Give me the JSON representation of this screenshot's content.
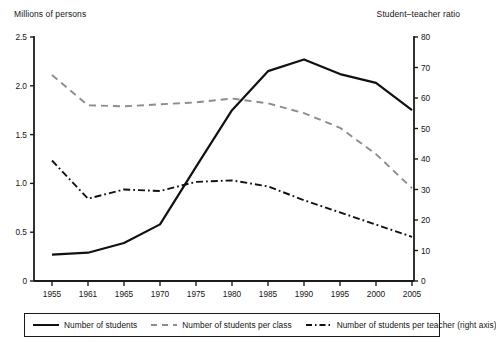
{
  "axes": {
    "left_title": "Millions of persons",
    "right_title": "Student–teacher ratio"
  },
  "legend": {
    "items": [
      {
        "label": "Number of students",
        "style": "solid",
        "color": "#111111"
      },
      {
        "label": "Number of students per class",
        "style": "dashed",
        "color": "#8c8c8c"
      },
      {
        "label": "Number of students per teacher (right axis)",
        "style": "dashdot",
        "color": "#111111"
      }
    ]
  },
  "chart_data": {
    "type": "line",
    "title": "",
    "xlabel": "",
    "ylabel": "Millions of persons",
    "y2label": "Student–teacher ratio",
    "grid": false,
    "legend_position": "bottom",
    "categories": [
      "1955",
      "1961",
      "1965",
      "1970",
      "1975",
      "1980",
      "1985",
      "1990",
      "1995",
      "2000",
      "2005"
    ],
    "x_ticks": [
      "1955",
      "1961",
      "1965",
      "1970",
      "1975",
      "1980",
      "1985",
      "1990",
      "1995",
      "2000",
      "2005"
    ],
    "ylim": [
      0,
      2.5
    ],
    "y_ticks": [
      "0",
      "0.5",
      "1.0",
      "1.5",
      "2.0",
      "2.5"
    ],
    "y_tick_values": [
      0,
      0.5,
      1.0,
      1.5,
      2.0,
      2.5
    ],
    "y2lim": [
      0,
      80
    ],
    "y2_ticks": [
      "0",
      "10",
      "20",
      "30",
      "40",
      "50",
      "60",
      "70",
      "80"
    ],
    "y2_tick_values": [
      0,
      10,
      20,
      30,
      40,
      50,
      60,
      70,
      80
    ],
    "series": [
      {
        "name": "Number of students",
        "axis": "left",
        "style": "solid",
        "color": "#111111",
        "values": [
          0.27,
          0.29,
          0.39,
          0.58,
          1.17,
          1.75,
          2.15,
          2.27,
          2.12,
          2.03,
          1.75
        ]
      },
      {
        "name": "Number of students per class",
        "axis": "left",
        "style": "dashed",
        "color": "#8c8c8c",
        "values": [
          2.11,
          1.8,
          1.79,
          1.81,
          1.83,
          1.87,
          1.82,
          1.72,
          1.57,
          1.3,
          0.95
        ]
      },
      {
        "name": "Number of students per teacher (right axis)",
        "axis": "right",
        "style": "dashdot",
        "color": "#111111",
        "values": [
          39.5,
          27.0,
          30.0,
          29.5,
          32.5,
          33.0,
          31.0,
          26.5,
          22.5,
          18.5,
          14.5
        ]
      }
    ]
  }
}
